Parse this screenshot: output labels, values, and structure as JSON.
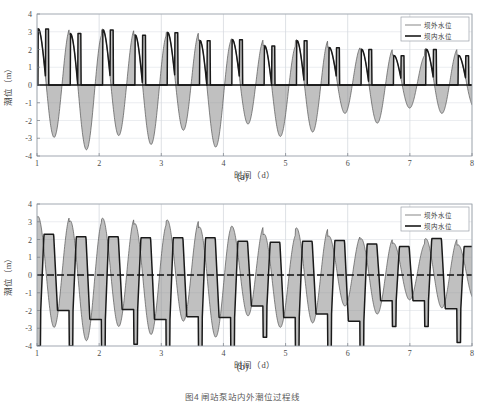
{
  "figure": {
    "caption": "图4  闸站泵站内外潮位过程线",
    "panels": [
      {
        "id": "a",
        "caption": "(a)",
        "legend": [
          {
            "label": "坝外水位",
            "style": "thin",
            "color": "#555555"
          },
          {
            "label": "坝内水位",
            "style": "thick",
            "color": "#1a1a1a"
          }
        ],
        "chart_data": {
          "type": "line",
          "title": "",
          "xlabel": "时间（d）",
          "ylabel": "潮位（m）",
          "xlim": [
            1,
            8
          ],
          "ylim": [
            -4,
            4
          ],
          "xticks": [
            1,
            2,
            3,
            4,
            5,
            6,
            7,
            8
          ],
          "yticks": [
            -4,
            -3,
            -2,
            -1,
            0,
            1,
            2,
            3,
            4
          ],
          "grid": true,
          "legend_position": "top-right",
          "annotations": [
            "(a)"
          ],
          "series": [
            {
              "name": "坝外水位",
              "style": "thin",
              "color": "#555555",
              "description": "平滑正弦潮位曲线，周期约0.52 d，振幅自3.2 m衰减至1.7 m",
              "period": 0.52,
              "phase": 0.0,
              "amplitude_start": 3.25,
              "amplitude_end": 1.7,
              "mean": 0.0,
              "peaks": [
                3.2,
                2.9,
                3.15,
                2.85,
                3.0,
                2.55,
                2.6,
                2.25,
                2.55,
                2.15,
                2.05,
                1.7,
                2.05,
                1.7
              ],
              "troughs": [
                -2.95,
                -3.65,
                -2.85,
                -3.35,
                -2.55,
                -3.5,
                -2.2,
                -2.9,
                -2.65,
                -1.6,
                -2.15,
                -1.3,
                -1.6,
                -1.25
              ]
            },
            {
              "name": "坝内水位",
              "style": "thick",
              "color": "#1a1a1a",
              "description": "闸控内水位：涨潮时跟随外水位上升至峰值并保持平顶，退潮时落至0 m后保持水平直到下一涨潮",
              "hold_level": 0.0,
              "period": 0.52,
              "peaks": [
                3.15,
                2.9,
                3.1,
                2.8,
                2.95,
                2.5,
                2.55,
                2.2,
                2.5,
                2.1,
                2.0,
                1.65,
                2.0,
                1.65
              ],
              "troughs": [
                0.0,
                0.0,
                0.0,
                0.0,
                0.0,
                0.0,
                0.0,
                0.0,
                0.0,
                0.0,
                0.0,
                0.0,
                0.0,
                0.0
              ]
            }
          ],
          "fill": {
            "between": [
              "坝外水位",
              "坝内水位"
            ],
            "color": "#8c8c8c",
            "description": "两条曲线之间的阴影区域表示内外水位差"
          }
        }
      },
      {
        "id": "b",
        "caption": "(b)",
        "legend": [
          {
            "label": "坝外水位",
            "style": "thin",
            "color": "#555555"
          },
          {
            "label": "坝内水位",
            "style": "thick",
            "color": "#1a1a1a"
          }
        ],
        "chart_data": {
          "type": "line",
          "title": "",
          "xlabel": "时间（d）",
          "ylabel": "潮位（m）",
          "xlim": [
            1,
            8
          ],
          "ylim": [
            -4,
            4
          ],
          "xticks": [
            1,
            2,
            3,
            4,
            5,
            6,
            7,
            8
          ],
          "yticks": [
            -4,
            -3,
            -2,
            -1,
            0,
            1,
            2,
            3,
            4
          ],
          "grid": true,
          "legend_position": "top-right",
          "annotations": [
            "(b)"
          ],
          "zero_line_style": "dashed",
          "series": [
            {
              "name": "坝外水位",
              "style": "thin",
              "color": "#555555",
              "description": "平滑正弦潮位曲线，周期约0.52 d，振幅自3.3 m衰减至1.7 m",
              "period": 0.52,
              "phase": 0.0,
              "amplitude_start": 3.3,
              "amplitude_end": 1.7,
              "mean": 0.0,
              "peaks": [
                3.3,
                3.05,
                3.2,
                2.9,
                3.1,
                2.7,
                2.75,
                2.3,
                2.65,
                2.2,
                2.05,
                1.8,
                2.05,
                1.7
              ],
              "troughs": [
                -2.95,
                -3.7,
                -2.9,
                -3.35,
                -2.6,
                -3.5,
                -2.3,
                -2.95,
                -2.7,
                -1.75,
                -2.2,
                -1.4,
                -1.85,
                -1.35
              ]
            },
            {
              "name": "坝内水位",
              "style": "thick",
              "color": "#1a1a1a",
              "description": "泵控内水位：在约+2.2 m与-2.0 m之间呈平顶平底方波式波动，相位略滞后于外水位",
              "period": 0.52,
              "phase_lag": 0.06,
              "high_level": 2.2,
              "low_level": -2.0,
              "peaks": [
                2.3,
                2.15,
                2.15,
                2.1,
                2.1,
                2.1,
                1.9,
                1.85,
                1.9,
                1.95,
                1.75,
                1.6,
                2.05,
                1.6
              ],
              "troughs": [
                -2.0,
                -2.5,
                -1.95,
                -2.5,
                -2.35,
                -2.4,
                -1.75,
                -2.4,
                -2.2,
                -2.6,
                -1.45,
                -1.45,
                -1.9,
                -1.1
              ]
            }
          ],
          "fill": {
            "between": [
              "坝外水位",
              "坝内水位"
            ],
            "color": "#8c8c8c",
            "description": "两条曲线之间的阴影区域表示内外水位差"
          }
        }
      }
    ]
  }
}
